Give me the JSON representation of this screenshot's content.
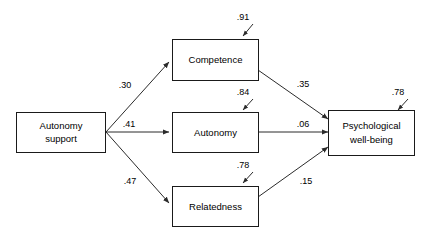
{
  "diagram": {
    "type": "path-analysis-model",
    "nodes": [
      {
        "id": "autonomy_support",
        "label_line1": "Autonomy",
        "label_line2": "support"
      },
      {
        "id": "competence",
        "label_line1": "Competence",
        "label_line2": ""
      },
      {
        "id": "autonomy",
        "label_line1": "Autonomy",
        "label_line2": ""
      },
      {
        "id": "relatedness",
        "label_line1": "Relatedness",
        "label_line2": ""
      },
      {
        "id": "psychological_well_being",
        "label_line1": "Psychological",
        "label_line2": "well-being"
      }
    ],
    "paths": [
      {
        "id": "as_to_competence",
        "from": "autonomy_support",
        "to": "competence",
        "coefficient": ".30"
      },
      {
        "id": "as_to_autonomy",
        "from": "autonomy_support",
        "to": "autonomy",
        "coefficient": ".41"
      },
      {
        "id": "as_to_relatedness",
        "from": "autonomy_support",
        "to": "relatedness",
        "coefficient": ".47"
      },
      {
        "id": "competence_to_pwb",
        "from": "competence",
        "to": "psychological_well_being",
        "coefficient": ".35"
      },
      {
        "id": "autonomy_to_pwb",
        "from": "autonomy",
        "to": "psychological_well_being",
        "coefficient": ".06"
      },
      {
        "id": "relatedness_to_pwb",
        "from": "relatedness",
        "to": "psychological_well_being",
        "coefficient": ".15"
      }
    ],
    "residuals": [
      {
        "id": "competence_residual",
        "target": "competence",
        "value": ".91"
      },
      {
        "id": "autonomy_residual",
        "target": "autonomy",
        "value": ".84"
      },
      {
        "id": "relatedness_residual",
        "target": "relatedness",
        "value": ".78"
      },
      {
        "id": "pwb_residual",
        "target": "psychological_well_being",
        "value": ".78"
      }
    ],
    "colors": {
      "background": "#ffffff",
      "box_stroke": "#1a1a1a",
      "line": "#2b2b2b",
      "text": "#000000"
    }
  }
}
